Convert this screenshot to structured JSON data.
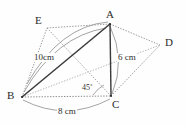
{
  "figure": {
    "background_color": "#fefefe",
    "stroke_solid_color": "#3a3a3a",
    "stroke_dotted_color": "#8d8d8d",
    "arc_color": "#9a9a9a",
    "label_color": "#2b2b2b",
    "vertices": [
      {
        "id": "A",
        "label": "A",
        "x": 110,
        "y": 24,
        "label_x": 106,
        "label_y": 9
      },
      {
        "id": "B",
        "label": "B",
        "x": 22,
        "y": 97,
        "label_x": 7,
        "label_y": 90
      },
      {
        "id": "C",
        "label": "C",
        "x": 111,
        "y": 96,
        "label_x": 112,
        "label_y": 99
      },
      {
        "id": "D",
        "label": "D",
        "x": 160,
        "y": 45,
        "label_x": 165,
        "label_y": 37
      },
      {
        "id": "E",
        "label": "E",
        "x": 47,
        "y": 28,
        "label_x": 35,
        "label_y": 15
      }
    ],
    "measurements": [
      {
        "id": "ab-length",
        "text": "10cm",
        "x": 33,
        "y": 53
      },
      {
        "id": "ac-length",
        "text": "6 cm",
        "x": 117,
        "y": 53
      },
      {
        "id": "bc-length",
        "text": "8 cm",
        "x": 57,
        "y": 107
      },
      {
        "id": "angle-acb",
        "text": "45˚",
        "x": 82,
        "y": 84
      }
    ],
    "edges": [
      {
        "id": "edge-BA",
        "from": "B",
        "to": "A",
        "style": "solid"
      },
      {
        "id": "edge-AC",
        "from": "A",
        "to": "C",
        "style": "solid"
      },
      {
        "id": "edge-BC",
        "from": "B",
        "to": "C",
        "style": "dotted"
      },
      {
        "id": "edge-BE",
        "from": "B",
        "to": "E",
        "style": "dotted"
      },
      {
        "id": "edge-EA",
        "from": "E",
        "to": "A",
        "style": "dotted"
      },
      {
        "id": "edge-EC",
        "from": "E",
        "to": "C",
        "style": "dotted"
      },
      {
        "id": "edge-AD",
        "from": "A",
        "to": "D",
        "style": "dotted"
      },
      {
        "id": "edge-CD",
        "from": "C",
        "to": "D",
        "style": "dotted"
      },
      {
        "id": "edge-BD",
        "from": "B",
        "to": "D",
        "style": "dotted"
      }
    ],
    "arcs": [
      {
        "id": "arc-BA-10cm",
        "label_ref": "ab-length"
      },
      {
        "id": "arc-AC-6cm",
        "label_ref": "ac-length"
      },
      {
        "id": "arc-BC-8cm",
        "label_ref": "bc-length"
      },
      {
        "id": "arc-angle-45",
        "label_ref": "angle-acb"
      },
      {
        "id": "arc-BEA-top",
        "label_ref": null
      }
    ]
  }
}
